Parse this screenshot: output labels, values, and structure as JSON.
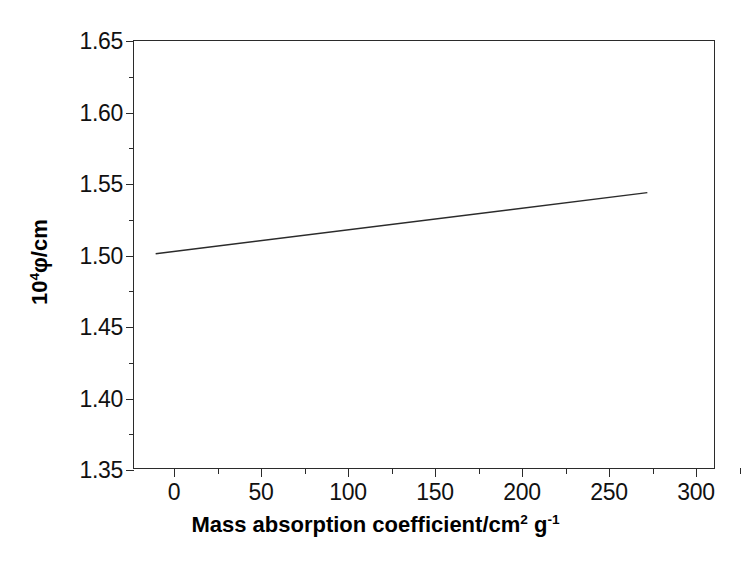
{
  "chart_data": {
    "type": "line",
    "title": "",
    "subtitle": "",
    "xlabel_plain": "Mass absorption coefficient/cm^2 g^-1",
    "xlabel_main": "Mass absorption coefficient/cm",
    "xlabel_sup1": "2",
    "xlabel_mid": " g",
    "xlabel_sup2": "-1",
    "ylabel_plain": "10^4 phi/cm",
    "ylabel_pre": "10",
    "ylabel_sup": "4",
    "ylabel_post": "φ/cm",
    "xlim": [
      -8,
      340
    ],
    "ylim": [
      1.35,
      1.65
    ],
    "xticks": [
      0,
      50,
      100,
      150,
      200,
      250,
      300
    ],
    "xtick_labels": [
      "0",
      "50",
      "100",
      "150",
      "200",
      "250",
      "300"
    ],
    "xticks_minor": [
      25,
      75,
      125,
      175,
      225,
      275,
      325
    ],
    "yticks": [
      1.35,
      1.4,
      1.45,
      1.5,
      1.55,
      1.6,
      1.65
    ],
    "ytick_labels": [
      "1.35",
      "1.40",
      "1.45",
      "1.50",
      "1.55",
      "1.60",
      "1.65"
    ],
    "yticks_minor": [
      1.375,
      1.425,
      1.475,
      1.525,
      1.575,
      1.625
    ],
    "grid": false,
    "legend": false,
    "legend_position": "none",
    "line_color": "#2b2b2b",
    "line_width": 1.4,
    "axis_color": "#2b2b2b",
    "background": "#ffffff",
    "series": [
      {
        "name": "fit-line",
        "x": [
          5,
          300
        ],
        "y": [
          1.5005,
          1.5435
        ]
      }
    ],
    "annotations": []
  }
}
